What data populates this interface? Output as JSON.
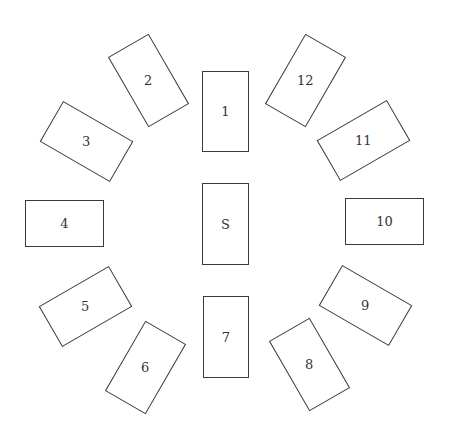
{
  "diagram": {
    "type": "tarot-spread",
    "positions": [
      {
        "label": "1",
        "cx": 225.5,
        "cy": 111.5,
        "w": 47,
        "h": 81,
        "rot": 0
      },
      {
        "label": "2",
        "cx": 148,
        "cy": 80,
        "w": 47,
        "h": 81,
        "rot": -30
      },
      {
        "label": "3",
        "cx": 86,
        "cy": 141,
        "w": 81,
        "h": 47,
        "rot": 30
      },
      {
        "label": "4",
        "cx": 64.5,
        "cy": 223.5,
        "w": 79,
        "h": 47,
        "rot": 0
      },
      {
        "label": "5",
        "cx": 85.5,
        "cy": 306.5,
        "w": 81,
        "h": 47,
        "rot": -30
      },
      {
        "label": "6",
        "cx": 145,
        "cy": 367,
        "w": 47,
        "h": 81,
        "rot": 30
      },
      {
        "label": "7",
        "cx": 226,
        "cy": 337,
        "w": 46,
        "h": 82,
        "rot": 0
      },
      {
        "label": "8",
        "cx": 309,
        "cy": 364.5,
        "w": 47,
        "h": 81,
        "rot": -30
      },
      {
        "label": "9",
        "cx": 365,
        "cy": 305.5,
        "w": 81,
        "h": 47,
        "rot": 30
      },
      {
        "label": "10",
        "cx": 384.5,
        "cy": 221.5,
        "w": 79,
        "h": 47,
        "rot": 0
      },
      {
        "label": "11",
        "cx": 363,
        "cy": 140,
        "w": 81,
        "h": 47,
        "rot": -30
      },
      {
        "label": "12",
        "cx": 305,
        "cy": 80,
        "w": 47,
        "h": 81,
        "rot": 30
      },
      {
        "label": "S",
        "cx": 225.5,
        "cy": 224,
        "w": 47,
        "h": 82,
        "rot": 0
      }
    ]
  }
}
